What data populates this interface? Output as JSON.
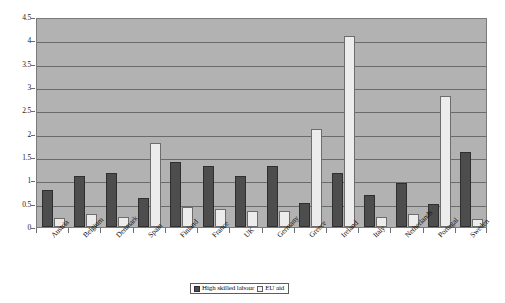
{
  "chart_data": {
    "type": "bar",
    "title": "",
    "xlabel": "",
    "ylabel": "",
    "ylim": [
      0,
      4.5
    ],
    "ytick_labels": [
      "0",
      "0.5",
      "1",
      "1.5",
      "2",
      "2.5",
      "3",
      "3.5",
      "4",
      "4.5"
    ],
    "ytick_values": [
      0,
      0.5,
      1,
      1.5,
      2,
      2.5,
      3,
      3.5,
      4,
      4.5
    ],
    "grid": true,
    "legend_position": "bottom",
    "categories": [
      "Austria",
      "Belgium",
      "Denmark",
      "Spain",
      "Finland",
      "France",
      "UK",
      "Germany",
      "Greece",
      "Ireland",
      "Italy",
      "Netherlands",
      "Portugal",
      "Sweden"
    ],
    "series": [
      {
        "name": "High skilled labour",
        "color": "#4d4d4d",
        "values": [
          0.8,
          1.1,
          1.15,
          0.62,
          1.4,
          1.3,
          1.1,
          1.3,
          0.52,
          1.15,
          0.68,
          0.95,
          0.5,
          1.6
        ]
      },
      {
        "name": "EU aid",
        "color": "#ececec",
        "values": [
          0.2,
          0.27,
          0.22,
          1.8,
          0.42,
          0.38,
          0.35,
          0.35,
          2.1,
          4.1,
          0.22,
          0.27,
          2.8,
          0.18
        ]
      }
    ]
  },
  "legend": {
    "items": [
      {
        "label": "High skilled labour",
        "swatch": "dark"
      },
      {
        "label": "EU aid",
        "swatch": "light"
      }
    ]
  }
}
